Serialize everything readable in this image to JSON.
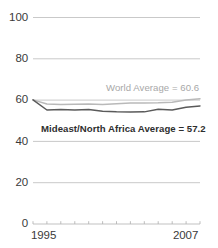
{
  "chart_data": {
    "type": "line",
    "title": "",
    "subtitle": "",
    "xlabel": "",
    "ylabel": "",
    "xlim": [
      1995,
      2007
    ],
    "ylim": [
      0,
      100
    ],
    "y_ticks": [
      0,
      20,
      40,
      60,
      80,
      100
    ],
    "y_tick_labels": [
      "0",
      "20",
      "40",
      "60",
      "80",
      "100"
    ],
    "x_tick_labels": [
      "1995",
      "2007"
    ],
    "x_ticks_minor": [
      1995,
      1996,
      1997,
      1998,
      1999,
      2000,
      2001,
      2002,
      2003,
      2004,
      2005,
      2006,
      2007
    ],
    "grid": true,
    "grid_axis": "y",
    "legend": "inline-annotations",
    "x": [
      1995,
      1996,
      1997,
      1998,
      1999,
      2000,
      2001,
      2002,
      2003,
      2004,
      2005,
      2006,
      2007
    ],
    "series": [
      {
        "name": "World Average",
        "color": "#b9b9b9",
        "values": [
          60.1,
          58.1,
          57.9,
          58.0,
          58.1,
          57.9,
          58.2,
          58.6,
          58.6,
          58.7,
          59.0,
          60.0,
          60.6
        ]
      },
      {
        "name": "Mideast/North Africa Average",
        "color": "#5a5a5a",
        "values": [
          60.1,
          55.2,
          55.4,
          55.2,
          55.5,
          54.6,
          54.3,
          54.2,
          54.3,
          55.6,
          55.2,
          56.5,
          57.2
        ]
      }
    ],
    "annotations": [
      {
        "id": "world-average-label",
        "text": "World Average = 60.6",
        "color": "#a8a8a8",
        "value": 60.6
      },
      {
        "id": "mideast-average-label",
        "text": "Mideast/North Africa Average = 57.2",
        "color": "#2e2e2e",
        "value": 57.2
      }
    ]
  },
  "axes": {
    "y_labels": [
      "100",
      "80",
      "60",
      "40",
      "20",
      "0"
    ],
    "x_label_start": "1995",
    "x_label_end": "2007"
  },
  "labels": {
    "world": "World Average = 60.6",
    "mideast": "Mideast/North Africa Average = 57.2"
  },
  "colors": {
    "world_line": "#b9b9b9",
    "mideast_line": "#5a5a5a",
    "gridline": "#c9c9c9",
    "axis_text": "#3a3a3a"
  }
}
